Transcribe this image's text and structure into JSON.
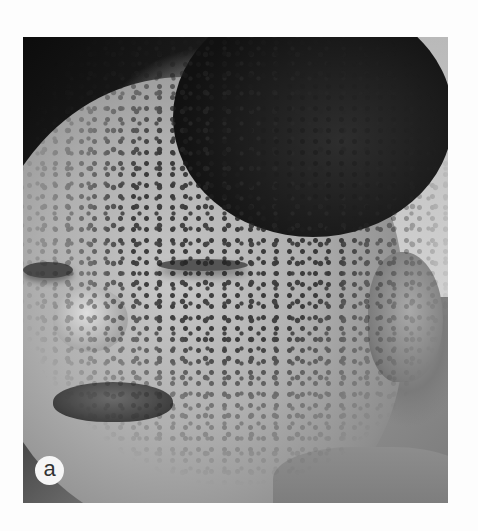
{
  "figure": {
    "panel_label": "a",
    "colors": {
      "page_background": "#fdfdfd",
      "label_badge_background": "#f6f6f6",
      "label_text": "#333333"
    }
  }
}
